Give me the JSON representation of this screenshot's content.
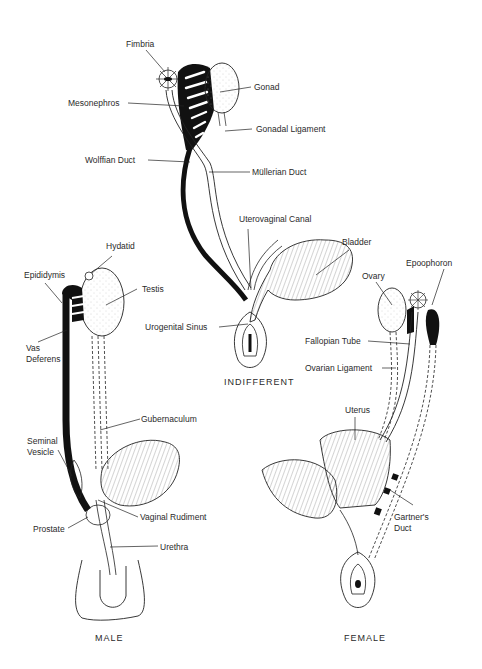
{
  "figure": {
    "panels": {
      "indifferent": {
        "caption": "INDIFFERENT",
        "labels": {
          "fimbria": "Fimbria",
          "gonad": "Gonad",
          "mesonephros": "Mesonephros",
          "gonadal_ligament": "Gonadal Ligament",
          "wolffian_duct": "Wolffian Duct",
          "mullerian_duct": "Müllerian Duct",
          "uterovaginal_canal": "Uterovaginal Canal",
          "bladder": "Bladder",
          "urogenital_sinus": "Urogenital Sinus"
        }
      },
      "male": {
        "caption": "MALE",
        "labels": {
          "hydatid": "Hydatid",
          "epididymis": "Epididymis",
          "testis": "Testis",
          "vas_deferens_1": "Vas",
          "vas_deferens_2": "Deferens",
          "gubernaculum": "Gubernaculum",
          "seminal_vesicle_1": "Seminal",
          "seminal_vesicle_2": "Vesicle",
          "vaginal_rudiment": "Vaginal Rudiment",
          "prostate": "Prostate",
          "urethra": "Urethra"
        }
      },
      "female": {
        "caption": "FEMALE",
        "labels": {
          "ovary": "Ovary",
          "epoophoron": "Epoophoron",
          "fallopian_tube": "Fallopian Tube",
          "ovarian_ligament": "Ovarian Ligament",
          "uterus": "Uterus",
          "gartners_duct_1": "Gartner's",
          "gartners_duct_2": "Duct"
        }
      }
    },
    "colors": {
      "ink": "#111111",
      "paper": "#ffffff",
      "label": "#2a2a2a"
    }
  }
}
